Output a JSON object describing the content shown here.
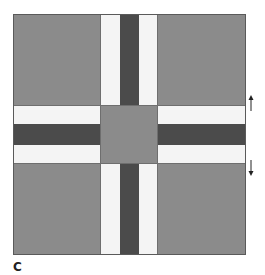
{
  "figure": {
    "label": "C",
    "colors": {
      "corner": "#8b8b8b",
      "center": "#8b8b8b",
      "stripe_dark": "#4b4b4b",
      "stripe_light": "#f4f4f4",
      "outline": "#5a5a5a"
    },
    "annotations": {
      "up_arrow": "↑",
      "down_arrow": "↓"
    }
  }
}
